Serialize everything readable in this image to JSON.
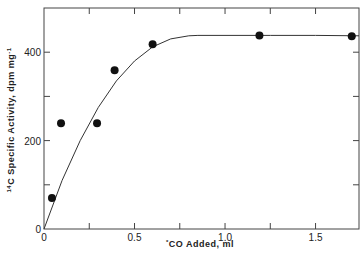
{
  "chart_data": {
    "type": "scatter",
    "title": "",
    "xlabel": "*CO Added, ml",
    "ylabel": "14C Specific Activity, dpm mg-1",
    "ylabel_parts": {
      "sup_pre": "14",
      "main": "C Specific Activity, dpm mg",
      "sup_post": "-1"
    },
    "xlabel_parts": {
      "sup_pre": "*",
      "main": "CO Added, ml"
    },
    "xlim": [
      0,
      1.74
    ],
    "ylim": [
      0,
      500
    ],
    "x_ticks": [
      0,
      0.25,
      0.5,
      0.75,
      1.0,
      1.25,
      1.5
    ],
    "x_tick_labels": [
      "0",
      "",
      "0.5",
      "",
      "1.0",
      "",
      "1.5"
    ],
    "y_ticks": [
      0,
      100,
      200,
      300,
      400
    ],
    "y_tick_labels": [
      "0",
      "",
      "200",
      "",
      "400"
    ],
    "grid": false,
    "legend": null,
    "series": [
      {
        "name": "measured",
        "kind": "points",
        "x": [
          0.044,
          0.094,
          0.293,
          0.39,
          0.6,
          1.19,
          1.7
        ],
        "y": [
          70,
          239,
          239,
          359,
          418,
          438,
          436
        ]
      },
      {
        "name": "fitted curve",
        "kind": "line",
        "x": [
          0,
          0.1,
          0.2,
          0.3,
          0.4,
          0.5,
          0.6,
          0.7,
          0.8,
          0.85,
          1.0,
          1.25,
          1.5,
          1.74
        ],
        "y": [
          0,
          110,
          200,
          275,
          335,
          380,
          412,
          430,
          437,
          438,
          438,
          438,
          438,
          437
        ]
      }
    ]
  }
}
